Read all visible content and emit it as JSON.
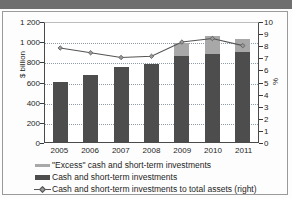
{
  "chart_data": {
    "type": "bar",
    "title": "",
    "subtitle": "",
    "xlabel": "",
    "ylabel": "$ billion",
    "ylabel_right": "%",
    "categories": [
      "2005",
      "2006",
      "2007",
      "2008",
      "2009",
      "2010",
      "2011"
    ],
    "ylim": [
      0,
      1200
    ],
    "yticks": [
      0,
      200,
      400,
      600,
      800,
      1000,
      1200
    ],
    "ytick_labels": [
      "0",
      "200",
      "400",
      "600",
      "800",
      "1 000",
      "1 200"
    ],
    "ylim_right": [
      0,
      10
    ],
    "yticks_right": [
      0,
      1,
      2,
      3,
      4,
      5,
      6,
      7,
      8,
      9,
      10
    ],
    "ytick_labels_right": [
      "0",
      "1",
      "2",
      "3",
      "4",
      "5",
      "6",
      "7",
      "8",
      "9",
      "10"
    ],
    "grid": true,
    "legend_position": "below",
    "stacked": true,
    "series": [
      {
        "name": "Cash and short-term investments",
        "type": "bar",
        "axis": "left",
        "color": "#4d4d4d",
        "values": [
          600,
          660,
          740,
          775,
          855,
          875,
          890
        ]
      },
      {
        "name": "\"Excess\" cash and short-term investments",
        "type": "bar",
        "axis": "left",
        "color": "#a8a8a8",
        "values": [
          0,
          0,
          0,
          0,
          125,
          175,
          130
        ]
      },
      {
        "name": "Cash and short-term investments to total assets (right)",
        "type": "line",
        "axis": "right",
        "color": "#555555",
        "values": [
          7.9,
          7.5,
          7.1,
          7.2,
          8.4,
          8.7,
          8.1
        ]
      }
    ],
    "legend": [
      "\"Excess\" cash and short-term investments",
      "Cash and short-term investments",
      "Cash and short-term investments to total assets (right)"
    ]
  },
  "colors": {
    "excess": "#a8a8a8",
    "cash": "#4d4d4d",
    "line": "#555555",
    "grid": "#8e9ba8",
    "axis": "#4a4a4a",
    "frame": "#9a9a9a",
    "background": "#fdfdfd",
    "artifact": "#6f6f6f"
  }
}
